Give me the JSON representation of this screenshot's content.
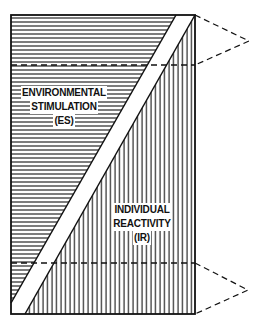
{
  "diagram": {
    "colors": {
      "ink": "#111111",
      "background": "#ffffff"
    },
    "regions": {
      "environmental_stimulation": {
        "lines": [
          "ENVIRONMENTAL",
          "STIMULATION",
          "(ES)"
        ],
        "hatch": "horizontal"
      },
      "individual_reactivity": {
        "lines": [
          "INDIVIDUAL",
          "REACTIVITY",
          "(IR)"
        ],
        "hatch": "vertical"
      }
    },
    "dashed_markers": [
      {
        "name": "upper",
        "position": "top"
      },
      {
        "name": "lower",
        "position": "bottom"
      }
    ]
  }
}
